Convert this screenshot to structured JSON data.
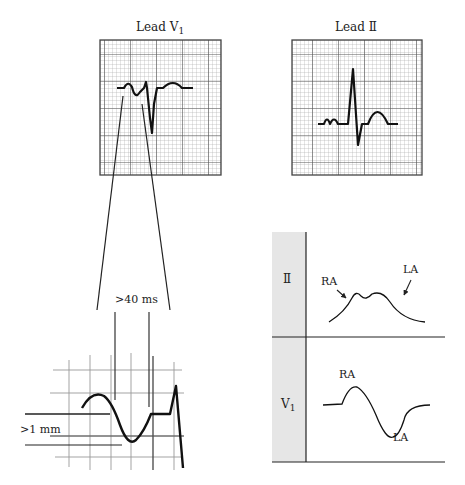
{
  "panels": {
    "lead_v1": {
      "title": "Lead V",
      "subscript": "1"
    },
    "lead_ii": {
      "title": "Lead Ⅱ"
    },
    "detail": {
      "duration_label": ">40 ms",
      "depth_label": ">1 mm"
    },
    "p_wave_table": {
      "row1": {
        "lead": "Ⅱ",
        "label_left": "RA",
        "label_right": "LA"
      },
      "row2": {
        "lead": "V",
        "lead_subscript": "1",
        "label_top": "RA",
        "label_bottom": "LA"
      }
    }
  },
  "colors": {
    "ink": "#1a1a1a",
    "grid_minor": "#9a9a9a",
    "grid_major": "#555555",
    "table_shade": "#e6e6e6"
  }
}
